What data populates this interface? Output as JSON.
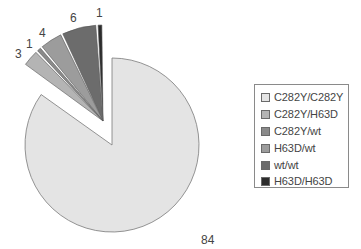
{
  "chart_data": {
    "type": "pie",
    "title": "",
    "categories": [
      "C282Y/C282Y",
      "C282Y/H63D",
      "C282Y/wt",
      "H63D/wt",
      "wt/wt",
      "H63D/H63D"
    ],
    "values": [
      84,
      3,
      1,
      4,
      6,
      1
    ],
    "total": 99,
    "colors": [
      "#e4e4e4",
      "#b4b4b4",
      "#8a8a8a",
      "#9c9c9c",
      "#6c6c6c",
      "#2c2c2c"
    ],
    "exploded": [
      "C282Y/H63D",
      "C282Y/wt",
      "H63D/wt",
      "wt/wt",
      "H63D/H63D"
    ],
    "data_labels": [
      "84",
      "3",
      "1",
      "4",
      "6",
      "1"
    ],
    "legend_position": "right",
    "grid": false
  },
  "legend": {
    "items": [
      {
        "label": "C282Y/C282Y",
        "color": "#e4e4e4"
      },
      {
        "label": "C282Y/H63D",
        "color": "#b4b4b4"
      },
      {
        "label": "C282Y/wt",
        "color": "#8a8a8a"
      },
      {
        "label": "H63D/wt",
        "color": "#9c9c9c"
      },
      {
        "label": "wt/wt",
        "color": "#6c6c6c"
      },
      {
        "label": "H63D/H63D",
        "color": "#2c2c2c"
      }
    ]
  },
  "labels": {
    "l0": "84",
    "l1": "3",
    "l2": "1",
    "l3": "4",
    "l4": "6",
    "l5": "1"
  }
}
